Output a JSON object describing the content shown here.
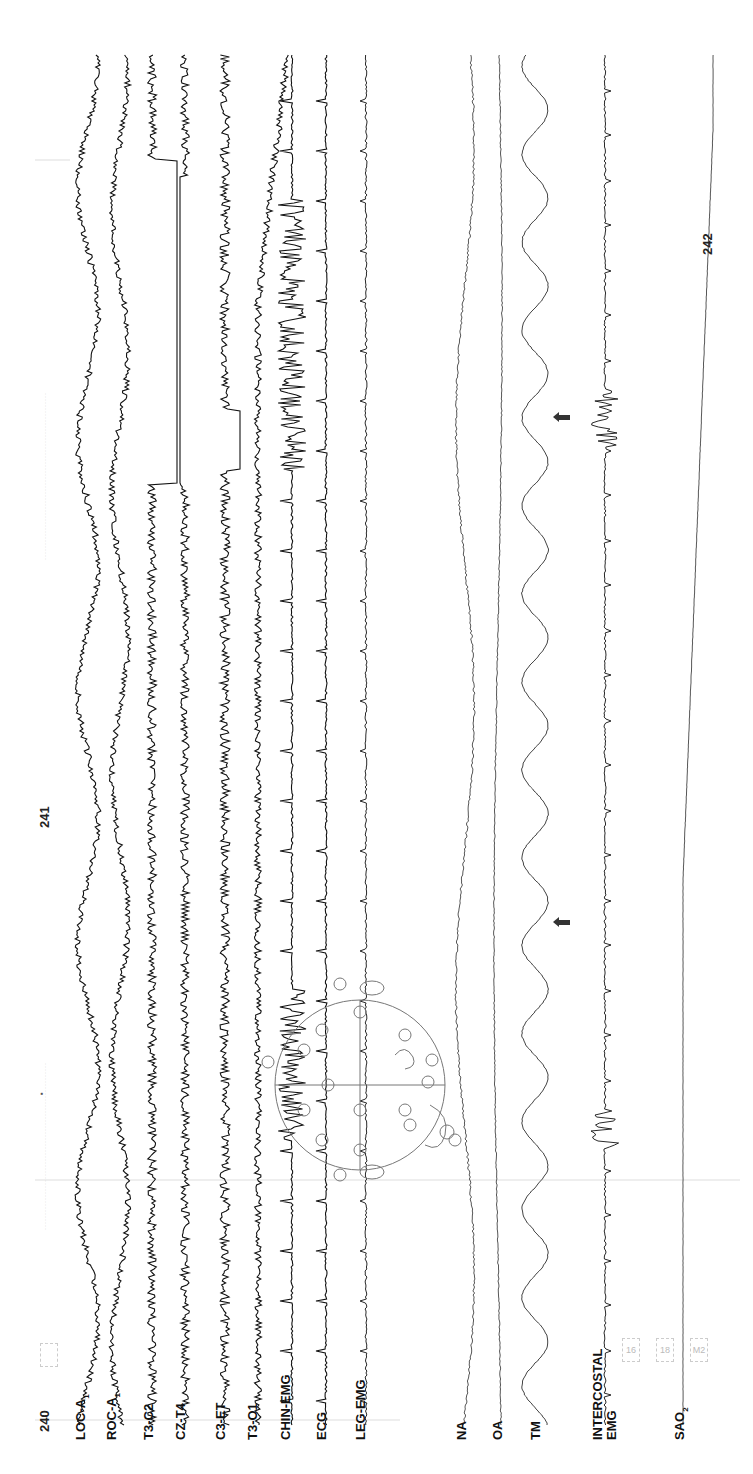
{
  "chart_data": {
    "type": "line",
    "orientation": "time axis runs bottom-to-top; channels arranged left-to-right",
    "page_markers": [
      "240",
      "241",
      "242"
    ],
    "channels": [
      {
        "name": "LOC-A1",
        "label_main": "LOC-A",
        "label_sub": "1",
        "kind": "EOG"
      },
      {
        "name": "ROC-A1",
        "label_main": "ROC-A",
        "label_sub": "1",
        "kind": "EOG"
      },
      {
        "name": "T3-C2",
        "label_main": "T3-C2",
        "kind": "EEG",
        "note": "flat segment (artifact/saturation) mid-record"
      },
      {
        "name": "CZ-T4",
        "label_main": "CZ-T4",
        "kind": "EEG",
        "note": "flat segment mid-record"
      },
      {
        "name": "C3-ET",
        "label_main": "C3-ET",
        "kind": "EEG",
        "note": "flat segment mid-record"
      },
      {
        "name": "T3-O1",
        "label_main": "T3-O1",
        "kind": "EEG",
        "note": "drifts near top"
      },
      {
        "name": "CHIN-EMG",
        "label_main": "CHIN-EMG",
        "kind": "EMG",
        "note": "bursts of high-amplitude activity at arousals"
      },
      {
        "name": "ECG",
        "label_main": "ECG",
        "kind": "ECG",
        "note": "regular spikes"
      },
      {
        "name": "LEG-EMG",
        "label_main": "LEG-EMG",
        "kind": "EMG"
      },
      {
        "name": "NA",
        "label_main": "NA",
        "kind": "Nasal airflow"
      },
      {
        "name": "OA",
        "label_main": "OA",
        "kind": "Oral airflow"
      },
      {
        "name": "TM",
        "label_main": "TM",
        "kind": "Thoracic movement",
        "note": "large oscillations during apnea events"
      },
      {
        "name": "INTERCOSTAL EMG",
        "label_main": "INTERCOSTAL",
        "label_line2": "EMG",
        "kind": "EMG"
      },
      {
        "name": "SAO2",
        "label_main": "SAO",
        "label_sub": "2",
        "kind": "Oxygen saturation",
        "note": "stepwise desaturation after page 241"
      }
    ],
    "annotations": [
      {
        "type": "arrow",
        "target": "TM",
        "position": "near page 241"
      },
      {
        "type": "arrow",
        "target": "TM",
        "position": "between pages 241 and 242"
      },
      {
        "type": "diagram",
        "description": "10-20 electrode placement head diagram overlay"
      }
    ],
    "stamps": [
      "16",
      "18",
      "M2"
    ],
    "xlabel": "",
    "ylabel": "",
    "grid": false
  },
  "labels": {
    "loc": "LOC-A",
    "loc_sub": "1",
    "roc": "ROC-A",
    "roc_sub": "1",
    "t3c2": "T3-C2",
    "czt4": "CZ-T4",
    "c3et": "C3-ET",
    "t3o1": "T3-O1",
    "chin": "CHIN-EMG",
    "ecg": "ECG",
    "leg": "LEG-EMG",
    "na": "NA",
    "oa": "OA",
    "tm": "TM",
    "inter1": "INTERCOSTAL",
    "inter2": "EMG",
    "sao": "SAO",
    "sao_sub": "2"
  },
  "markers": {
    "p240": "240",
    "p241": "241",
    "p242": "242"
  },
  "stamps": {
    "s1": "16",
    "s2": "18",
    "s3": "M2"
  }
}
